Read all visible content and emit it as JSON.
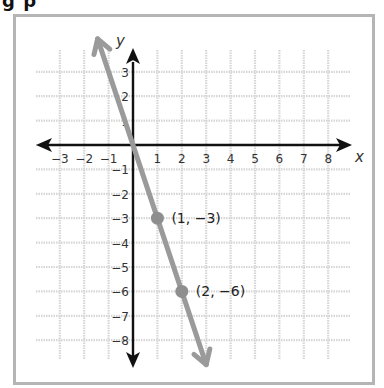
{
  "heading": "g p",
  "colors": {
    "frame": "#b5b5b5",
    "grid": "#d6d6d6",
    "axis": "#111111",
    "line": "#9a9a9a",
    "point": "#8e8e8e"
  },
  "chart_data": {
    "type": "line",
    "title": "",
    "xlabel": "x",
    "ylabel": "y",
    "xlim": [
      -4,
      9
    ],
    "ylim": [
      -9,
      4
    ],
    "grid": true,
    "x_ticks": [
      -3,
      -2,
      -1,
      1,
      2,
      3,
      4,
      5,
      6,
      7,
      8
    ],
    "y_ticks": [
      3,
      2,
      1,
      -1,
      -2,
      -3,
      -4,
      -5,
      -6,
      -7,
      -8
    ],
    "x_tick_labels": [
      "−3",
      "−2",
      "−1",
      "1",
      "2",
      "3",
      "4",
      "5",
      "6",
      "7",
      "8"
    ],
    "y_tick_labels": [
      "3",
      "2",
      "1",
      "−1",
      "−2",
      "−3",
      "−4",
      "−5",
      "−6",
      "−7",
      "−8"
    ],
    "series": [
      {
        "name": "y = -3x",
        "equation": "y = -3x",
        "x": [
          -1.45,
          3.0
        ],
        "y": [
          4.35,
          -9.0
        ]
      }
    ],
    "points": [
      {
        "x": 1,
        "y": -3,
        "label": "(1, −3)"
      },
      {
        "x": 2,
        "y": -6,
        "label": "(2, −6)"
      }
    ]
  }
}
